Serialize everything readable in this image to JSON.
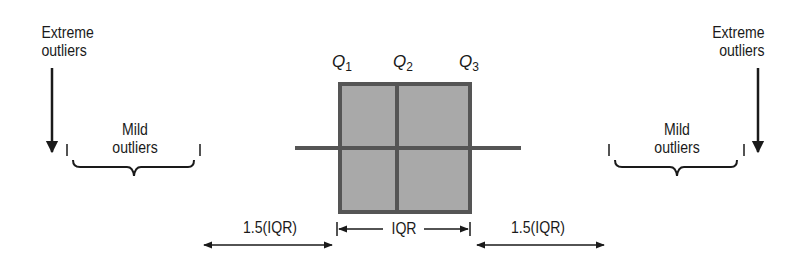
{
  "diagram": {
    "title": "",
    "quartile_labels": {
      "q1": "Q",
      "q1_sub": "1",
      "q2": "Q",
      "q2_sub": "2",
      "q3": "Q",
      "q3_sub": "3"
    },
    "left": {
      "extreme_line1": "Extreme",
      "extreme_line2": "outliers",
      "mild_line1": "Mild",
      "mild_line2": "outliers"
    },
    "right": {
      "extreme_line1": "Extreme",
      "extreme_line2": "outliers",
      "mild_line1": "Mild",
      "mild_line2": "outliers"
    },
    "bottom": {
      "left_range": "1.5(IQR)",
      "iqr": "IQR",
      "right_range": "1.5(IQR)"
    },
    "colors": {
      "box_fill": "#a9a9a9",
      "box_stroke": "#555555",
      "ink": "#1a1a1a"
    }
  }
}
